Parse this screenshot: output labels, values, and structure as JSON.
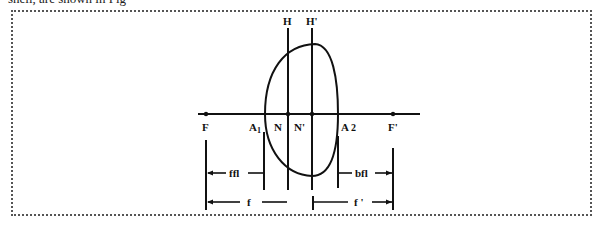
{
  "caption": "shell, are shown in Fig",
  "diagram": {
    "labels": {
      "H": "H",
      "H_prime": "H'",
      "F": "F",
      "A1": "A",
      "A1_sub": "1",
      "N": "N",
      "N_prime": "N'",
      "A2": "A",
      "A2_sub": "2",
      "F_prime": "F'",
      "ffl": "ffl",
      "bfl": "bfl",
      "f": "f",
      "f_prime": "f '"
    },
    "colors": {
      "stroke": "#111111",
      "frame": "#555555",
      "background": "#ffffff"
    }
  }
}
